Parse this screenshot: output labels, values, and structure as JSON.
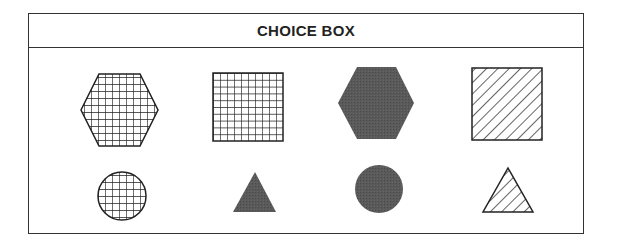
{
  "choice_box": {
    "title": "CHOICE BOX",
    "colors": {
      "border": "#333333",
      "stroke": "#222222",
      "fill_dark": "#555555",
      "background": "#ffffff"
    },
    "rows": [
      {
        "shapes": [
          {
            "shape": "hexagon",
            "pattern": "grid"
          },
          {
            "shape": "square",
            "pattern": "grid"
          },
          {
            "shape": "hexagon",
            "pattern": "solid-dark"
          },
          {
            "shape": "square",
            "pattern": "diagonal-hatch"
          }
        ]
      },
      {
        "shapes": [
          {
            "shape": "circle",
            "pattern": "grid"
          },
          {
            "shape": "triangle",
            "pattern": "solid-dark"
          },
          {
            "shape": "circle",
            "pattern": "solid-dark"
          },
          {
            "shape": "triangle",
            "pattern": "diagonal-hatch"
          }
        ]
      }
    ]
  }
}
